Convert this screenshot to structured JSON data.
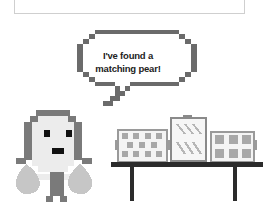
{
  "top_panel": {
    "text": ""
  },
  "speech_bubble": {
    "line1": "I've found a",
    "line2": "matching pear!"
  },
  "scene": {
    "character": "pixel-character",
    "items": [
      "box-pattern-dots",
      "box-pattern-stripes",
      "box-pattern-flowers"
    ],
    "furniture": "table"
  },
  "colors": {
    "outline": "#6b6b6b",
    "face": "#ececec",
    "pear": "#c4c4c4",
    "table": "#2b2b2b",
    "eye": "#111111"
  }
}
